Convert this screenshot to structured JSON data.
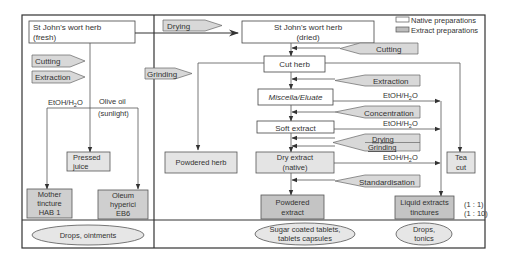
{
  "colors": {
    "background": "#ffffff",
    "line": "#333333",
    "native_fill": "#ffffff",
    "extract_fill": "#d6d6d6",
    "process_fill": "#d8d8d8",
    "ellipse_fill": "#e6e6e6",
    "text": "#333333"
  },
  "legend": {
    "native": "Native preparations",
    "extract": "Extract preparations"
  },
  "left_panel": {
    "fresh_herb": [
      "St John's wort herb",
      "(fresh)"
    ],
    "process_cutting": "Cutting",
    "process_extraction": "Extraction",
    "solvent_label": "EtOH/H",
    "solvent_sub": "2",
    "solvent_end": "O",
    "olive_oil": "Olive oil",
    "sunlight": "(sunlight)",
    "pressed_juice": [
      "Pressed",
      "juice"
    ],
    "mother_tincture": [
      "Mother",
      "tincture",
      "HAB 1"
    ],
    "oleum": [
      "Oleum",
      "hyperici",
      "EB6"
    ],
    "use": "Drops, ointments"
  },
  "right_panel": {
    "process_drying_top": "Drying",
    "process_grinding_left": "Grinding",
    "dried_herb": [
      "St John's wort herb",
      "(dried)"
    ],
    "process_cutting": "Cutting",
    "cut_herb": "Cut herb",
    "process_extraction": "Extraction",
    "miscella": "Miscella/Eluate",
    "process_concentration": "Concentration",
    "soft_extract": "Soft extract",
    "process_drying": "Drying",
    "process_grinding": "Grinding",
    "dry_extract": [
      "Dry extract",
      "(native)"
    ],
    "process_standardisation": "Standardisation",
    "powdered_herb": "Powdered herb",
    "powdered_extract": [
      "Powdered",
      "extract"
    ],
    "tea_cut": [
      "Tea",
      "cut"
    ],
    "liquid_extracts": [
      "Liquid extracts",
      "tinctures"
    ],
    "ratio_1": "(1 : 1)",
    "ratio_2": "(1 : 10)",
    "solvent_label": "EtOH/H",
    "solvent_sub": "2",
    "solvent_end": "O",
    "use_tablets": [
      "Sugar coated tablets,",
      "tablets capsules"
    ],
    "use_drops": [
      "Drops,",
      "tonics"
    ]
  }
}
